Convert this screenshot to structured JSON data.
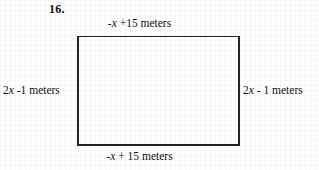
{
  "problem": {
    "number": "16."
  },
  "figure": {
    "shape_name": "rectangle",
    "labels": {
      "top": {
        "prefix": "-",
        "variable": "x",
        "suffix": "  +15 meters",
        "full_text": "-x  +15 meters"
      },
      "bottom": {
        "prefix": "-",
        "variable": "x",
        "suffix": " + 15 meters",
        "full_text": "-x + 15 meters"
      },
      "left": {
        "prefix": "2",
        "variable": "x",
        "suffix": " -1 meters",
        "full_text": "2x -1 meters"
      },
      "right": {
        "prefix": "2",
        "variable": "x",
        "suffix": " - 1 meters",
        "full_text": "2x - 1 meters"
      }
    }
  },
  "colors": {
    "stroke": "#232323",
    "text": "#111111",
    "background": "#fefefe"
  }
}
